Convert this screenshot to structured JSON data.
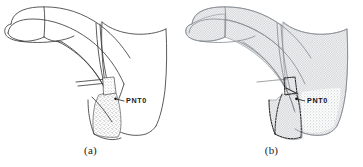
{
  "figure": {
    "background_color": "#ffffff",
    "line_color": "#3a3a3a",
    "mesh_color": "#9aa0a6",
    "speckle_color": "#8d8d8d",
    "label_color": "#1b1b1b",
    "panels": [
      {
        "id": "a",
        "caption": "(a)",
        "annotation": "PNT0",
        "annotation_marker": "pnt0-marker",
        "render_style": "surface-wireframe",
        "description_name": "curved-duct-surface-view"
      },
      {
        "id": "b",
        "caption": "(b)",
        "annotation": "PNT0",
        "annotation_marker": "pnt0-marker",
        "render_style": "mesh-hatched",
        "description_name": "curved-duct-mesh-view"
      }
    ]
  }
}
